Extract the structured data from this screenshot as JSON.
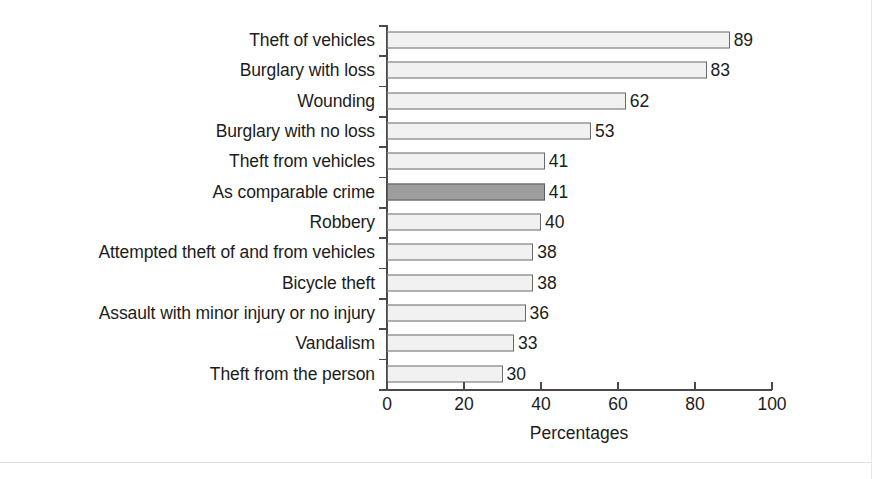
{
  "chart_data": {
    "type": "bar",
    "orientation": "horizontal",
    "title": "",
    "xlabel": "Percentages",
    "ylabel": "",
    "xlim": [
      0,
      100
    ],
    "xticks": [
      0,
      20,
      40,
      60,
      80,
      100
    ],
    "grid": false,
    "legend": null,
    "categories": [
      "Theft of vehicles",
      "Burglary with loss",
      "Wounding",
      "Burglary with no loss",
      "Theft from vehicles",
      "As comparable crime",
      "Robbery",
      "Attempted theft of and from vehicles",
      "Bicycle theft",
      "Assault with minor injury or no injury",
      "Vandalism",
      "Theft from the person"
    ],
    "values": [
      89,
      83,
      62,
      53,
      41,
      41,
      40,
      38,
      38,
      36,
      33,
      30
    ],
    "highlighted_category": "As comparable crime",
    "colors": {
      "bar_fill": "#f1f1f1",
      "bar_border": "#6a6a6a",
      "highlight_fill": "#9d9d9d",
      "highlight_border": "#5c5c5c",
      "axis": "#4a4a4a",
      "text": "#1c1c1c",
      "background": "#ffffff"
    }
  }
}
